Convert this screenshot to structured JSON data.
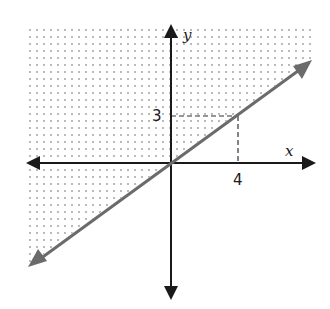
{
  "graph": {
    "type": "linear-inequality-graph",
    "x_axis_label": "x",
    "y_axis_label": "y",
    "tick_labels": {
      "x": "4",
      "y": "3"
    },
    "boundary_line": {
      "equation": "y = (3/4)x",
      "style": "solid",
      "color": "#6b6b6b",
      "passes_through": [
        [
          0,
          0
        ],
        [
          4,
          3
        ]
      ]
    },
    "reference_point": [
      4,
      3
    ],
    "shaded_region": "above boundary line",
    "shading_pattern": "dots",
    "colors": {
      "axis": "#1a1a1a",
      "line": "#6b6b6b",
      "dots": "#9a9a9a",
      "dashed": "#333333"
    }
  }
}
